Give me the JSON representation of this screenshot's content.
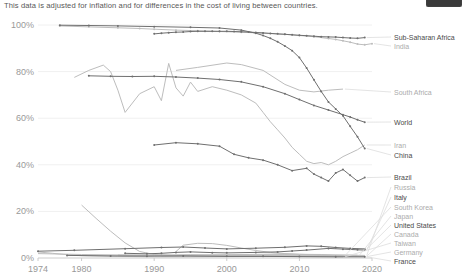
{
  "header": {
    "subtitle": "This data is adjusted for inflation and for differences in the cost of living between countries."
  },
  "colors": {
    "line_dark": "#6f6f6f",
    "line_light": "#bdbdbd",
    "label_dark": "#4a4a4a",
    "label_light": "#ababab",
    "axis_text": "#999999",
    "grid": "#f0f0f0",
    "axis_line": "#cccccc",
    "leader": "#dddddd",
    "button_bg": "#3a3a3a"
  },
  "chart_data": {
    "type": "line",
    "title": "",
    "subtitle": "This data is adjusted for inflation and for differences in the cost of living between countries.",
    "xlabel": "",
    "ylabel": "",
    "x_range": [
      1974,
      2020
    ],
    "y_range": [
      0,
      100
    ],
    "x_ticks": [
      1974,
      1980,
      1990,
      2000,
      2010,
      2020
    ],
    "y_ticks": [
      0,
      20,
      40,
      60,
      80,
      100
    ],
    "y_tick_suffix": "%",
    "grid": true,
    "legend_position": "right",
    "series": [
      {
        "name": "Sub-Saharan Africa",
        "emphasis": "dark",
        "markers": true,
        "label_y": 37,
        "points": [
          [
            1990,
            96.2
          ],
          [
            1991,
            96.5
          ],
          [
            1992,
            96.7
          ],
          [
            1993,
            96.9
          ],
          [
            1994,
            97.0
          ],
          [
            1995,
            97.2
          ],
          [
            1996,
            97.3
          ],
          [
            1997,
            97.3
          ],
          [
            1998,
            97.3
          ],
          [
            1999,
            97.3
          ],
          [
            2000,
            97.3
          ],
          [
            2001,
            97.2
          ],
          [
            2002,
            97.1
          ],
          [
            2003,
            97.0
          ],
          [
            2004,
            96.8
          ],
          [
            2005,
            96.6
          ],
          [
            2006,
            96.4
          ],
          [
            2007,
            96.2
          ],
          [
            2008,
            96.0
          ],
          [
            2009,
            95.8
          ],
          [
            2010,
            95.6
          ],
          [
            2011,
            95.4
          ],
          [
            2012,
            95.2
          ],
          [
            2013,
            95.0
          ],
          [
            2014,
            94.9
          ],
          [
            2015,
            94.8
          ],
          [
            2016,
            94.6
          ],
          [
            2017,
            94.4
          ],
          [
            2018,
            94.3
          ],
          [
            2019,
            94.6
          ]
        ]
      },
      {
        "name": "India",
        "emphasis": "light",
        "markers": true,
        "label_y": 46,
        "points": [
          [
            1977,
            99.6
          ],
          [
            1981,
            99.2
          ],
          [
            1985,
            98.8
          ],
          [
            1988,
            98.5
          ],
          [
            1990,
            98.2
          ],
          [
            1993,
            97.8
          ],
          [
            1996,
            97.5
          ],
          [
            1999,
            97.2
          ],
          [
            2002,
            96.9
          ],
          [
            2005,
            96.5
          ],
          [
            2008,
            96.0
          ],
          [
            2010,
            95.5
          ],
          [
            2012,
            95.0
          ],
          [
            2014,
            94.2
          ],
          [
            2015,
            93.8
          ],
          [
            2016,
            93.2
          ],
          [
            2017,
            92.6
          ],
          [
            2018,
            91.8
          ],
          [
            2019,
            91.5
          ],
          [
            2020,
            92.0
          ]
        ]
      },
      {
        "name": "South Africa",
        "emphasis": "light",
        "markers": false,
        "label_y": 92,
        "points": [
          [
            1993,
            80.5
          ],
          [
            1996,
            81.8
          ],
          [
            2000,
            83.7
          ],
          [
            2002,
            83.0
          ],
          [
            2005,
            80.5
          ],
          [
            2008,
            74.5
          ],
          [
            2010,
            72.0
          ],
          [
            2012,
            71.3
          ],
          [
            2014,
            72.0
          ],
          [
            2016,
            72.5
          ]
        ]
      },
      {
        "name": "World",
        "emphasis": "dark",
        "markers": true,
        "label_y": 122,
        "points": [
          [
            1981,
            78.2
          ],
          [
            1984,
            78.0
          ],
          [
            1987,
            77.9
          ],
          [
            1990,
            78.0
          ],
          [
            1993,
            77.7
          ],
          [
            1996,
            77.2
          ],
          [
            1999,
            76.6
          ],
          [
            2002,
            75.6
          ],
          [
            2005,
            73.5
          ],
          [
            2008,
            70.5
          ],
          [
            2010,
            68.0
          ],
          [
            2012,
            65.5
          ],
          [
            2014,
            63.5
          ],
          [
            2016,
            61.5
          ],
          [
            2017,
            60.5
          ],
          [
            2018,
            59.3
          ],
          [
            2019,
            58.3
          ]
        ]
      },
      {
        "name": "Iran",
        "emphasis": "light",
        "markers": false,
        "label_y": 145,
        "points": [
          [
            1979,
            77.5
          ],
          [
            1981,
            80.5
          ],
          [
            1983,
            82.8
          ],
          [
            1984,
            80.0
          ],
          [
            1985,
            72.0
          ],
          [
            1986,
            62.5
          ],
          [
            1988,
            70.5
          ],
          [
            1990,
            73.5
          ],
          [
            1991,
            67.5
          ],
          [
            1992,
            83.5
          ],
          [
            1993,
            73.0
          ],
          [
            1994,
            69.5
          ],
          [
            1995,
            75.5
          ],
          [
            1996,
            71.5
          ],
          [
            1998,
            73.5
          ],
          [
            2000,
            72.0
          ],
          [
            2002,
            70.0
          ],
          [
            2004,
            66.5
          ],
          [
            2005,
            62.5
          ],
          [
            2006,
            58.5
          ],
          [
            2007,
            55.0
          ],
          [
            2008,
            51.5
          ],
          [
            2009,
            47.5
          ],
          [
            2010,
            44.5
          ],
          [
            2011,
            41.5
          ],
          [
            2012,
            40.5
          ],
          [
            2013,
            41.0
          ],
          [
            2014,
            40.0
          ],
          [
            2015,
            41.5
          ],
          [
            2016,
            43.5
          ],
          [
            2017,
            45.0
          ],
          [
            2018,
            46.5
          ],
          [
            2019,
            48.5
          ]
        ]
      },
      {
        "name": "China",
        "emphasis": "dark",
        "markers": true,
        "label_y": 155,
        "points": [
          [
            1977,
            99.9
          ],
          [
            1981,
            99.8
          ],
          [
            1985,
            99.6
          ],
          [
            1990,
            99.3
          ],
          [
            1995,
            99.0
          ],
          [
            1999,
            98.7
          ],
          [
            2002,
            97.8
          ],
          [
            2004,
            96.5
          ],
          [
            2005,
            95.5
          ],
          [
            2006,
            94.3
          ],
          [
            2007,
            92.8
          ],
          [
            2008,
            91.0
          ],
          [
            2009,
            89.0
          ],
          [
            2010,
            86.0
          ],
          [
            2011,
            81.5
          ],
          [
            2012,
            76.5
          ],
          [
            2013,
            71.5
          ],
          [
            2014,
            67.0
          ],
          [
            2015,
            64.0
          ],
          [
            2016,
            61.0
          ],
          [
            2017,
            56.5
          ],
          [
            2018,
            52.0
          ],
          [
            2019,
            47.0
          ]
        ]
      },
      {
        "name": "Brazil",
        "emphasis": "dark",
        "markers": true,
        "label_y": 177,
        "points": [
          [
            1990,
            48.5
          ],
          [
            1993,
            49.5
          ],
          [
            1996,
            49.0
          ],
          [
            1999,
            48.0
          ],
          [
            2001,
            44.5
          ],
          [
            2003,
            43.0
          ],
          [
            2005,
            42.0
          ],
          [
            2007,
            40.0
          ],
          [
            2009,
            37.5
          ],
          [
            2011,
            38.5
          ],
          [
            2012,
            36.0
          ],
          [
            2013,
            34.5
          ],
          [
            2014,
            33.0
          ],
          [
            2015,
            36.5
          ],
          [
            2016,
            38.0
          ],
          [
            2017,
            35.5
          ],
          [
            2018,
            33.0
          ],
          [
            2019,
            34.5
          ]
        ]
      },
      {
        "name": "Russia",
        "emphasis": "light",
        "markers": false,
        "label_y": 187,
        "points": [
          [
            1993,
            2.8
          ],
          [
            1994,
            5.5
          ],
          [
            1996,
            6.3
          ],
          [
            1998,
            6.2
          ],
          [
            2000,
            5.4
          ],
          [
            2002,
            4.3
          ],
          [
            2004,
            3.2
          ],
          [
            2006,
            2.4
          ],
          [
            2008,
            1.9
          ],
          [
            2010,
            1.6
          ],
          [
            2013,
            1.3
          ],
          [
            2016,
            1.2
          ],
          [
            2019,
            1.1
          ]
        ]
      },
      {
        "name": "Italy",
        "emphasis": "dark",
        "markers": true,
        "label_y": 197,
        "points": [
          [
            1986,
            2.0
          ],
          [
            1989,
            1.8
          ],
          [
            1991,
            2.0
          ],
          [
            1993,
            2.4
          ],
          [
            1995,
            2.6
          ],
          [
            1998,
            2.3
          ],
          [
            2000,
            2.2
          ],
          [
            2004,
            2.4
          ],
          [
            2007,
            2.6
          ],
          [
            2009,
            3.0
          ],
          [
            2011,
            3.4
          ],
          [
            2014,
            4.1
          ],
          [
            2016,
            3.8
          ],
          [
            2018,
            3.5
          ],
          [
            2019,
            3.4
          ]
        ]
      },
      {
        "name": "South Korea",
        "emphasis": "light",
        "markers": false,
        "label_y": 207,
        "points": [
          [
            1980,
            22.7
          ],
          [
            1982,
            17.0
          ],
          [
            1984,
            11.5
          ],
          [
            1986,
            6.5
          ],
          [
            1988,
            2.8
          ],
          [
            1990,
            1.5
          ],
          [
            1993,
            1.0
          ],
          [
            1996,
            0.9
          ],
          [
            2000,
            1.1
          ],
          [
            2004,
            1.3
          ],
          [
            2008,
            1.5
          ],
          [
            2012,
            1.2
          ],
          [
            2016,
            1.0
          ]
        ]
      },
      {
        "name": "Japan",
        "emphasis": "light",
        "markers": false,
        "label_y": 216,
        "points": [
          [
            1985,
            1.3
          ],
          [
            1990,
            1.1
          ],
          [
            1995,
            1.2
          ],
          [
            2000,
            1.4
          ],
          [
            2005,
            1.6
          ],
          [
            2008,
            1.8
          ],
          [
            2010,
            1.6
          ],
          [
            2013,
            1.5
          ],
          [
            2015,
            1.3
          ],
          [
            2018,
            1.2
          ]
        ]
      },
      {
        "name": "United States",
        "emphasis": "dark",
        "markers": true,
        "label_y": 225,
        "points": [
          [
            1974,
            2.9
          ],
          [
            1979,
            3.3
          ],
          [
            1986,
            4.0
          ],
          [
            1991,
            4.5
          ],
          [
            1994,
            4.7
          ],
          [
            1997,
            4.3
          ],
          [
            2000,
            3.9
          ],
          [
            2004,
            4.2
          ],
          [
            2008,
            4.6
          ],
          [
            2011,
            5.2
          ],
          [
            2013,
            5.0
          ],
          [
            2015,
            4.5
          ],
          [
            2017,
            4.1
          ],
          [
            2019,
            3.9
          ]
        ]
      },
      {
        "name": "Canada",
        "emphasis": "light",
        "markers": false,
        "label_y": 234,
        "points": [
          [
            1974,
            1.9
          ],
          [
            1980,
            1.5
          ],
          [
            1986,
            1.3
          ],
          [
            1990,
            1.2
          ],
          [
            1995,
            1.4
          ],
          [
            2000,
            1.2
          ],
          [
            2005,
            1.0
          ],
          [
            2010,
            0.9
          ],
          [
            2015,
            0.8
          ],
          [
            2019,
            0.8
          ]
        ]
      },
      {
        "name": "Taiwan",
        "emphasis": "light",
        "markers": false,
        "label_y": 243,
        "points": [
          [
            1974,
            2.6
          ],
          [
            1976,
            2.0
          ],
          [
            1978,
            1.4
          ],
          [
            1980,
            1.0
          ],
          [
            1985,
            0.7
          ],
          [
            1990,
            0.5
          ],
          [
            1995,
            0.5
          ],
          [
            2000,
            0.6
          ],
          [
            2005,
            0.7
          ],
          [
            2010,
            0.6
          ],
          [
            2016,
            0.5
          ]
        ]
      },
      {
        "name": "Germany",
        "emphasis": "light",
        "markers": false,
        "label_y": 252,
        "points": [
          [
            1991,
            0.8
          ],
          [
            1995,
            0.7
          ],
          [
            2000,
            0.8
          ],
          [
            2005,
            1.0
          ],
          [
            2010,
            0.9
          ],
          [
            2015,
            0.7
          ],
          [
            2019,
            0.6
          ]
        ]
      },
      {
        "name": "France",
        "emphasis": "dark",
        "markers": true,
        "label_y": 261,
        "points": [
          [
            1978,
            1.1
          ],
          [
            1984,
            0.9
          ],
          [
            1989,
            0.8
          ],
          [
            1994,
            0.9
          ],
          [
            2000,
            0.7
          ],
          [
            2005,
            0.7
          ],
          [
            2010,
            0.6
          ],
          [
            2015,
            0.5
          ],
          [
            2019,
            0.5
          ]
        ]
      }
    ]
  }
}
